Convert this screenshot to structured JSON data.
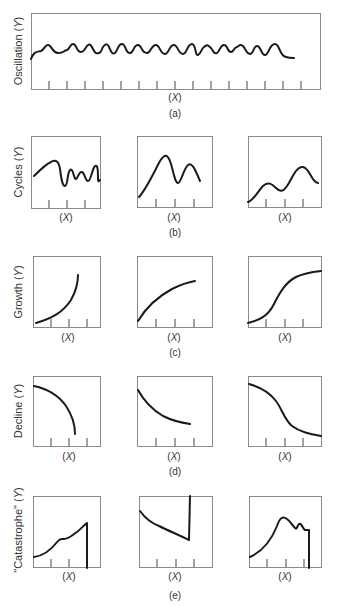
{
  "figure": {
    "rows": [
      {
        "id": "a",
        "caption": "(a)",
        "ylabel": "Oscillation (Y)",
        "panels": [
          {
            "xlabel": "(X)",
            "shape": "regular oscillation with many small waves"
          }
        ]
      },
      {
        "id": "b",
        "caption": "(b)",
        "ylabel": "Cycles (Y)",
        "panels": [
          {
            "xlabel": "(X)",
            "shape": "irregular cycles"
          },
          {
            "xlabel": "(X)",
            "shape": "two large peaks"
          },
          {
            "xlabel": "(X)",
            "shape": "two rising peaks"
          }
        ]
      },
      {
        "id": "c",
        "caption": "(c)",
        "ylabel": "Growth (Y)",
        "panels": [
          {
            "xlabel": "(X)",
            "shape": "exponential growth"
          },
          {
            "xlabel": "(X)",
            "shape": "decelerating growth"
          },
          {
            "xlabel": "(X)",
            "shape": "S-shaped (logistic) growth"
          }
        ]
      },
      {
        "id": "d",
        "caption": "(d)",
        "ylabel": "Decline (Y)",
        "panels": [
          {
            "xlabel": "(X)",
            "shape": "accelerating decline"
          },
          {
            "xlabel": "(X)",
            "shape": "decelerating decline"
          },
          {
            "xlabel": "(X)",
            "shape": "S-shaped decline"
          }
        ]
      },
      {
        "id": "e",
        "caption": "(e)",
        "ylabel": "\"Catastrophe\" (Y)",
        "panels": [
          {
            "xlabel": "(X)",
            "shape": "rise then sudden collapse"
          },
          {
            "xlabel": "(X)",
            "shape": "decline then sudden jump"
          },
          {
            "xlabel": "(X)",
            "shape": "peak, fluctuation then sudden collapse"
          }
        ]
      }
    ]
  }
}
